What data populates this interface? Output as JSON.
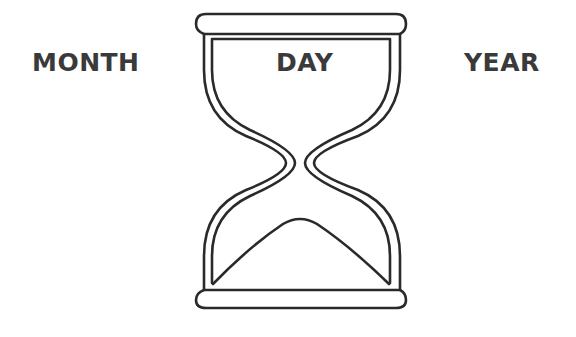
{
  "labels": {
    "left": "MONTH",
    "center": "DAY",
    "right": "YEAR"
  },
  "graphic": {
    "icon": "hourglass-icon",
    "stroke_color": "#2a2a2a",
    "background": "#ffffff"
  }
}
